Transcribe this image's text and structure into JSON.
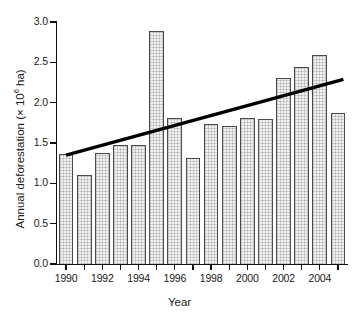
{
  "chart_data": {
    "type": "bar",
    "title": "",
    "xlabel": "Year",
    "ylabel_prefix": "Annual deforestation (× 10",
    "ylabel_exponent": "6",
    "ylabel_suffix": " ha)",
    "ylabel_full": "Annual deforestation (× 10⁶ ha)",
    "categories": [
      1990,
      1991,
      1992,
      1993,
      1994,
      1995,
      1996,
      1997,
      1998,
      1999,
      2000,
      2001,
      2002,
      2003,
      2004,
      2005
    ],
    "values": [
      1.37,
      1.1,
      1.38,
      1.48,
      1.48,
      2.89,
      1.81,
      1.31,
      1.73,
      1.71,
      1.81,
      1.8,
      2.31,
      2.44,
      2.59,
      1.87
    ],
    "ylim": [
      0.0,
      3.0
    ],
    "xlim": [
      1989.5,
      2005.5
    ],
    "ytick_values": [
      0.0,
      0.5,
      1.0,
      1.5,
      2.0,
      2.5,
      3.0
    ],
    "ytick_labels": [
      "0.0",
      "0.5",
      "1.0",
      "1.5",
      "2.0",
      "2.5",
      "3.0"
    ],
    "xtick_values": [
      1990,
      1991,
      1992,
      1993,
      1994,
      1995,
      1996,
      1997,
      1998,
      1999,
      2000,
      2001,
      2002,
      2003,
      2004,
      2005
    ],
    "xtick_labels": [
      "1990",
      "",
      "1992",
      "",
      "1994",
      "",
      "1996",
      "",
      "1998",
      "",
      "2000",
      "",
      "2002",
      "",
      "2004",
      ""
    ],
    "grid": false,
    "legend": null,
    "series": [
      {
        "name": "Annual deforestation",
        "type": "bar",
        "bar_color": "#f2f2f2",
        "bar_edge_color": "#4a4a4a",
        "values": [
          1.37,
          1.1,
          1.38,
          1.48,
          1.48,
          2.89,
          1.81,
          1.31,
          1.73,
          1.71,
          1.81,
          1.8,
          2.31,
          2.44,
          2.59,
          1.87
        ]
      },
      {
        "name": "Linear trend",
        "type": "line",
        "color": "#000000",
        "line_width": 3,
        "x_start": 1990.0,
        "y_start": 1.35,
        "x_end": 2005.3,
        "y_end": 2.29
      }
    ]
  }
}
